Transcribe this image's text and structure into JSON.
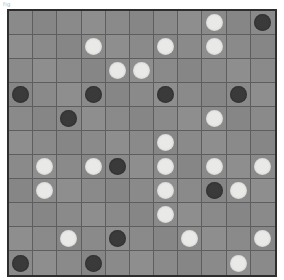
{
  "board": {
    "title": "grid board",
    "corner_mark": "fig",
    "rows": 11,
    "cols": 11,
    "colors": {
      "background": "#8a8a8a",
      "gridline": "#5e5e5e",
      "border": "#2e2e2e",
      "white_piece": "#e9e9e7",
      "dark_piece": "#3a3a3a",
      "page_background": "#ffffff"
    },
    "legend": {
      "white_label": "white piece",
      "dark_label": "dark piece",
      "empty_label": "empty cell"
    },
    "counts": {
      "white": 24,
      "dark": 13,
      "empty": 84,
      "total": 121
    },
    "cells": [
      [
        "",
        "",
        "",
        "",
        "",
        "",
        "",
        "",
        "white",
        "",
        "dark"
      ],
      [
        "",
        "",
        "",
        "white",
        "",
        "",
        "white",
        "",
        "white",
        "",
        ""
      ],
      [
        "",
        "",
        "",
        "",
        "white",
        "white",
        "",
        "",
        "",
        "",
        ""
      ],
      [
        "dark",
        "",
        "",
        "dark",
        "",
        "",
        "dark",
        "",
        "",
        "dark",
        ""
      ],
      [
        "",
        "",
        "dark",
        "",
        "",
        "",
        "",
        "",
        "white",
        "",
        ""
      ],
      [
        "",
        "",
        "",
        "",
        "",
        "",
        "white",
        "",
        "",
        "",
        ""
      ],
      [
        "",
        "white",
        "",
        "white",
        "dark",
        "",
        "white",
        "",
        "white",
        "",
        "white"
      ],
      [
        "",
        "white",
        "",
        "",
        "",
        "",
        "white",
        "",
        "dark",
        "white",
        ""
      ],
      [
        "",
        "",
        "",
        "",
        "",
        "",
        "white",
        "",
        "",
        "",
        ""
      ],
      [
        "",
        "",
        "white",
        "",
        "dark",
        "",
        "",
        "white",
        "",
        "",
        "white"
      ],
      [
        "dark",
        "",
        "",
        "dark",
        "",
        "",
        "",
        "",
        "",
        "white",
        ""
      ]
    ]
  }
}
